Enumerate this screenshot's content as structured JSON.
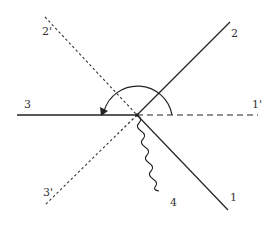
{
  "diagram": {
    "center": {
      "x": 137,
      "y": 115
    },
    "colors": {
      "stroke": "#222222",
      "label": "#333333",
      "background": "#ffffff"
    },
    "lines": [
      {
        "id": "1",
        "label": "1",
        "style": "solid"
      },
      {
        "id": "2",
        "label": "2",
        "style": "solid"
      },
      {
        "id": "3",
        "label": "3",
        "style": "solid"
      },
      {
        "id": "1p",
        "label": "1'",
        "style": "dashed"
      },
      {
        "id": "2p",
        "label": "2'",
        "style": "dotted"
      },
      {
        "id": "3p",
        "label": "3'",
        "style": "dotted"
      },
      {
        "id": "4",
        "label": "4",
        "style": "wavy"
      }
    ],
    "arc": {
      "description": "semicircular arrow from line 1' over top to line 3",
      "direction": "counterclockwise"
    }
  }
}
